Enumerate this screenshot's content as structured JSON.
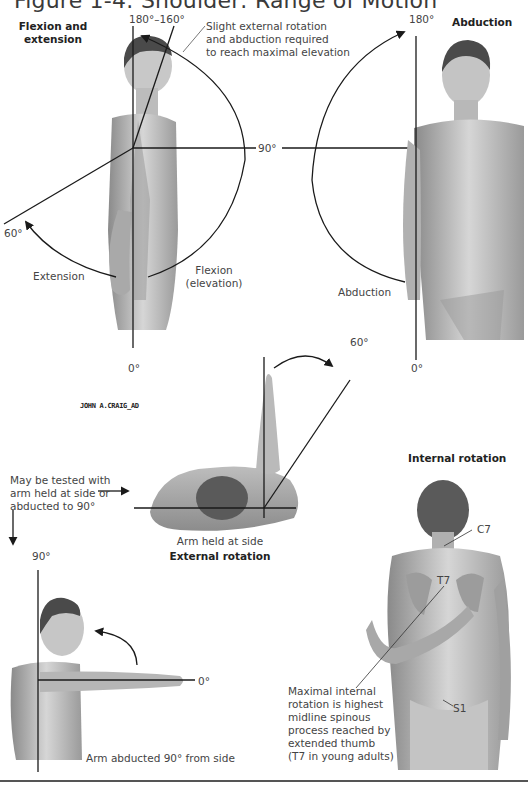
{
  "figure": {
    "title": "Figure 1-4: Shoulder: Range of Motion",
    "signature": "JOHN A.CRAIG_AD"
  },
  "panels": {
    "flexion_extension": {
      "heading_line1": "Flexion and",
      "heading_line2": "extension",
      "angle_top": "180°–160°",
      "angle_extension": "60°",
      "angle_bottom": "0°",
      "angle_horizontal": "90°",
      "extension_label": "Extension",
      "flexion_label_line1": "Flexion",
      "flexion_label_line2": "(elevation)",
      "note_line1": "Slight external rotation",
      "note_line2": "and abduction required",
      "note_line3": "to reach maximal elevation"
    },
    "abduction": {
      "heading": "Abduction",
      "angle_top": "180°",
      "angle_bottom": "0°",
      "abduction_label": "Abduction"
    },
    "external_rotation": {
      "heading": "External rotation",
      "caption": "Arm held at side",
      "angle": "60°",
      "test_note_line1": "May be tested with",
      "test_note_line2": "arm held at side or",
      "test_note_line3": "abducted to 90°"
    },
    "abducted_rotation": {
      "angle_top": "90°",
      "angle_horizontal": "0°",
      "caption": "Arm abducted 90° from side"
    },
    "internal_rotation": {
      "heading": "Internal rotation",
      "landmark_c7": "C7",
      "landmark_t7": "T7",
      "landmark_s1": "S1",
      "note_line1": "Maximal internal",
      "note_line2": "rotation is highest",
      "note_line3": "midline spinous",
      "note_line4": "process reached by",
      "note_line5": "extended thumb",
      "note_line6": "(T7 in young adults)"
    }
  },
  "colors": {
    "line": "#1a1a1a",
    "skin_light": "#d9d9d9",
    "skin_mid": "#a8a8a8",
    "skin_dark": "#6e6e6e",
    "hair": "#4a4a4a",
    "text": "#444444"
  }
}
